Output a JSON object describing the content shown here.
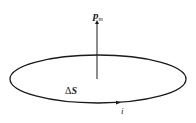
{
  "diagram": {
    "labels": {
      "moment": "p",
      "moment_sub": "m",
      "area": "ΔS",
      "area_delta": "Δ",
      "area_var": "S",
      "current": "i"
    },
    "colors": {
      "stroke": "#1a1a1a",
      "background": "#ffffff"
    }
  }
}
